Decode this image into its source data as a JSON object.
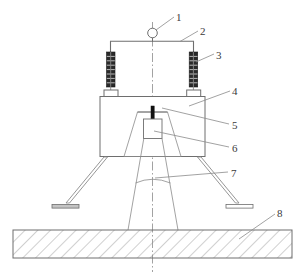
{
  "figure": {
    "type": "technical-line-drawing",
    "title": "",
    "background_color": "#ffffff",
    "line_color": "#6e6e6e",
    "dark_fill_color": "#1a1a1a",
    "hatch_color": "#8a8a8a",
    "centerline_style": "dash-dot",
    "width": 305,
    "height": 276
  },
  "callouts": [
    {
      "id": "1",
      "label": "1",
      "x": 176,
      "y": 12,
      "target": "suspension-ring"
    },
    {
      "id": "2",
      "label": "2",
      "x": 200,
      "y": 26,
      "target": "crossbar"
    },
    {
      "id": "3",
      "label": "3",
      "x": 216,
      "y": 50,
      "target": "right-spring"
    },
    {
      "id": "4",
      "label": "4",
      "x": 232,
      "y": 86,
      "target": "housing-box"
    },
    {
      "id": "5",
      "label": "5",
      "x": 232,
      "y": 120,
      "target": "emitter-tip"
    },
    {
      "id": "6",
      "label": "6",
      "x": 232,
      "y": 143,
      "target": "inner-square-module"
    },
    {
      "id": "7",
      "label": "7",
      "x": 231,
      "y": 168,
      "target": "arc-line"
    },
    {
      "id": "8",
      "label": "8",
      "x": 277,
      "y": 208,
      "target": "hatched-base-plate"
    }
  ],
  "parts": {
    "suspension_ring": {
      "cx": 152,
      "cy": 33,
      "r": 5
    },
    "crossbar": {
      "x1": 110,
      "y1": 41,
      "x2": 194,
      "y2": 41
    },
    "left_spring": {
      "cx": 111,
      "cy": 70,
      "coils": 8
    },
    "right_spring": {
      "cx": 193,
      "cy": 70,
      "coils": 8
    },
    "housing_box": {
      "x": 100,
      "y": 96,
      "w": 105,
      "h": 60
    },
    "emitter_tip": {
      "x": 151,
      "y": 106,
      "w": 3,
      "h": 14
    },
    "inner_square_module": {
      "x": 144,
      "y": 119,
      "w": 18,
      "h": 19
    },
    "base_plate": {
      "x": 13,
      "y": 230,
      "w": 279,
      "h": 28
    },
    "leg_feet": [
      {
        "x": 52,
        "y": 205,
        "w": 26,
        "h": 4
      },
      {
        "x": 227,
        "y": 205,
        "w": 26,
        "h": 4
      }
    ]
  }
}
